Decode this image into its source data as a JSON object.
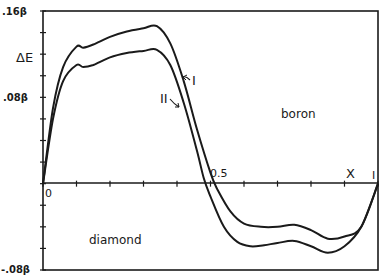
{
  "chart_data": {
    "type": "line",
    "title": "",
    "xlabel": "X",
    "ylabel": "ΔE",
    "xlim": [
      0,
      1
    ],
    "ylim": [
      -0.08,
      0.16
    ],
    "y_unit": "β",
    "x_ticks": [
      0,
      0.1,
      0.2,
      0.3,
      0.4,
      0.5,
      0.6,
      0.7,
      0.8,
      0.9,
      1.0
    ],
    "x_tick_labels": {
      "0": "0",
      "0.5": "0.5",
      "1": "I"
    },
    "y_ticks": [
      -0.08,
      -0.06,
      -0.04,
      -0.02,
      0,
      0.02,
      0.04,
      0.06,
      0.08,
      0.1,
      0.12,
      0.14,
      0.16
    ],
    "y_tick_labels": {
      ".16β": 0.16,
      ".08β": 0.08,
      "-.08β": -0.08
    },
    "grid": false,
    "annotations": [
      {
        "text": "boron",
        "region": "upper right"
      },
      {
        "text": "diamond",
        "region": "lower left"
      },
      {
        "text": "I",
        "points_to": "curve I"
      },
      {
        "text": "II",
        "points_to": "curve II"
      }
    ],
    "series": [
      {
        "name": "I",
        "x": [
          0.0,
          0.03,
          0.06,
          0.1,
          0.12,
          0.15,
          0.2,
          0.25,
          0.3,
          0.34,
          0.38,
          0.42,
          0.46,
          0.5,
          0.52,
          0.56,
          0.6,
          0.65,
          0.7,
          0.75,
          0.8,
          0.85,
          0.9,
          0.95,
          1.0
        ],
        "values": [
          0.0,
          0.07,
          0.108,
          0.127,
          0.126,
          0.129,
          0.136,
          0.141,
          0.144,
          0.146,
          0.13,
          0.095,
          0.05,
          0.01,
          -0.005,
          -0.026,
          -0.037,
          -0.04,
          -0.04,
          -0.038,
          -0.043,
          -0.051,
          -0.049,
          -0.04,
          0.0
        ]
      },
      {
        "name": "II",
        "x": [
          0.0,
          0.03,
          0.06,
          0.1,
          0.12,
          0.15,
          0.2,
          0.25,
          0.3,
          0.34,
          0.38,
          0.42,
          0.46,
          0.48,
          0.5,
          0.54,
          0.58,
          0.62,
          0.66,
          0.7,
          0.75,
          0.8,
          0.85,
          0.9,
          0.95,
          1.0
        ],
        "values": [
          0.0,
          0.06,
          0.095,
          0.11,
          0.108,
          0.11,
          0.117,
          0.121,
          0.123,
          0.124,
          0.11,
          0.075,
          0.03,
          0.005,
          -0.012,
          -0.04,
          -0.054,
          -0.058,
          -0.057,
          -0.055,
          -0.053,
          -0.058,
          -0.064,
          -0.058,
          -0.04,
          0.0
        ]
      }
    ]
  },
  "labels": {
    "y_top": ".16β",
    "y_mid": ".08β",
    "y_bottom": "-.08β",
    "y_axis": "ΔE",
    "x_zero": "0",
    "x_half": "0.5",
    "x_one": "I",
    "x_axis": "X",
    "region_upper": "boron",
    "region_lower": "diamond",
    "curve1": "I",
    "curve2": "II"
  }
}
